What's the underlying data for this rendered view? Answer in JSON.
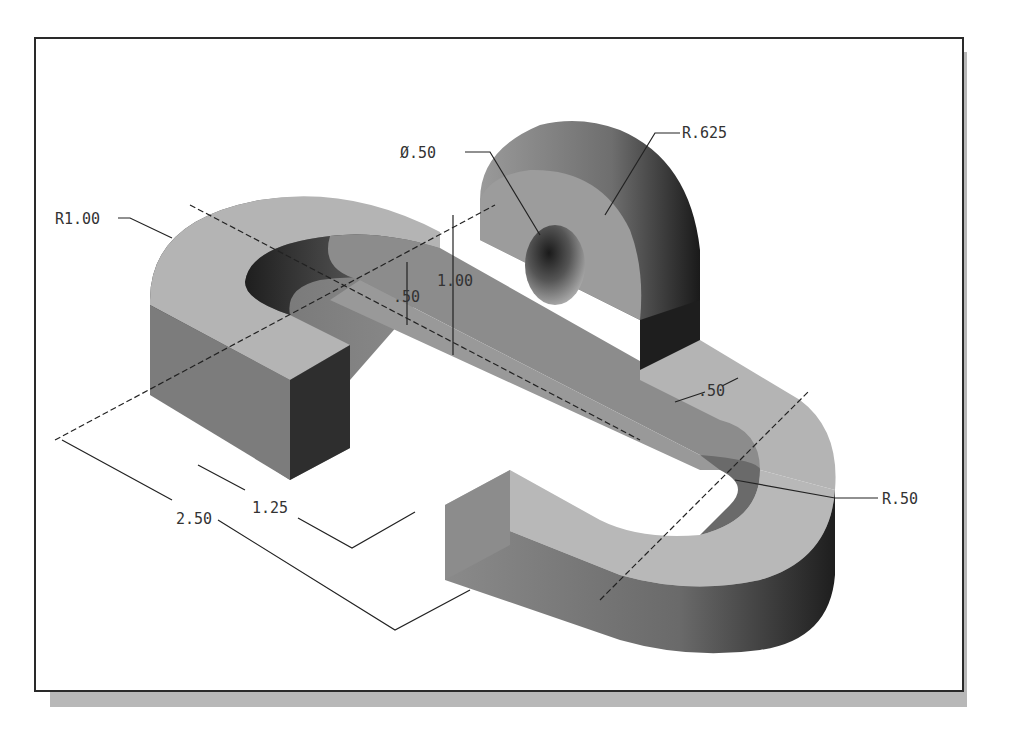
{
  "figure": {
    "type": "isometric-part-drawing",
    "colors": {
      "frame_border": "#2a2a2a",
      "shadow": "#b8b8b8",
      "surface_light": "#b4b4b4",
      "surface_mid": "#8a8a8a",
      "surface_dark": "#2e2e2e",
      "dimension_line": "#222222",
      "dimension_text": "#333333"
    },
    "dimensions": {
      "hole_diameter": "Ø.50",
      "boss_radius": "R.625",
      "outer_radius_left": "R1.00",
      "base_thickness": ".50",
      "boss_height": "1.00",
      "slot_width": ".50",
      "inner_radius_right": "R.50",
      "length_short": "1.25",
      "length_long": "2.50"
    }
  }
}
